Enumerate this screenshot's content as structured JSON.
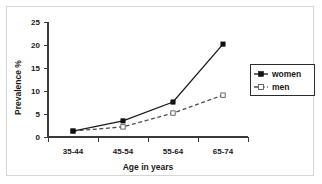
{
  "chart_data": {
    "type": "line",
    "title": "",
    "xlabel": "Age in years",
    "ylabel": "Prevalence %",
    "categories": [
      "35-44",
      "45-54",
      "55-64",
      "65-74"
    ],
    "yticks": [
      "0",
      "5",
      "10",
      "15",
      "20",
      "25"
    ],
    "ylim": [
      0,
      25
    ],
    "grid": false,
    "legend_position": "right",
    "series": [
      {
        "name": "women",
        "values": [
          1.3,
          3.5,
          7.6,
          20.2
        ],
        "line_style": "solid",
        "marker": "filled-square",
        "color": "#1a1a1a"
      },
      {
        "name": "men",
        "values": [
          1.3,
          2.2,
          5.2,
          9.1
        ],
        "line_style": "dashed",
        "marker": "open-square",
        "color": "#4d4d4d"
      }
    ]
  },
  "legend": {
    "entries": [
      {
        "label": "women"
      },
      {
        "label": "men"
      }
    ]
  },
  "axes": {
    "y_title": "Prevalence %",
    "x_title": "Age in years",
    "y_tick_labels": [
      "25",
      "20",
      "15",
      "10",
      "5",
      "0"
    ],
    "x_tick_labels": [
      "35-44",
      "45-54",
      "55-64",
      "65-74"
    ]
  },
  "colors": {
    "women_line": "#1a1a1a",
    "men_line": "#4d4d4d",
    "axis": "#3a3a3a",
    "frame": "#d6d6d6",
    "background": "#ffffff"
  }
}
